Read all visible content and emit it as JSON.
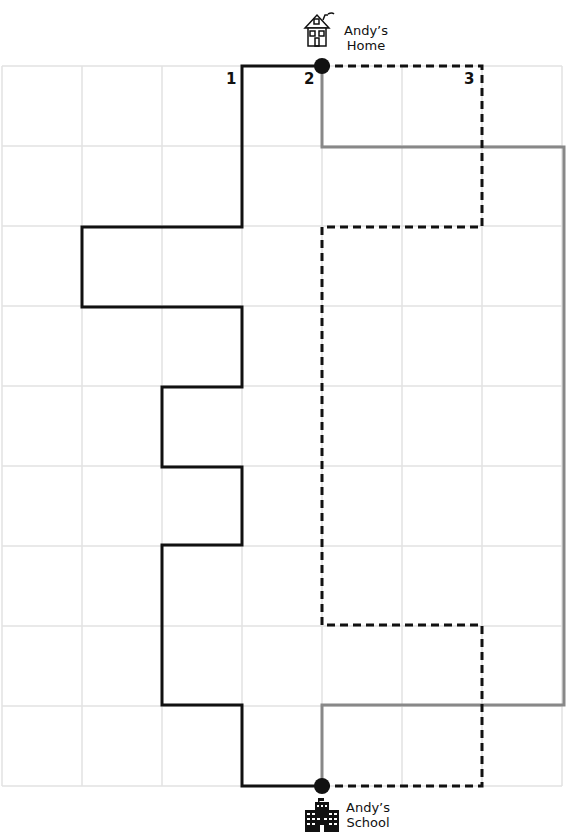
{
  "diagram": {
    "type": "grid-route-map",
    "grid": {
      "columns": 7,
      "rows": 9,
      "cell_size_px": 80,
      "origin": [
        2,
        66
      ],
      "line_color": "#e2e2e2"
    },
    "home": {
      "label_line1": "Andy’s",
      "label_line2": "Home",
      "point": [
        322,
        66
      ],
      "icon": "house-icon"
    },
    "school": {
      "label_line1": "Andy’s",
      "label_line2": "School",
      "point": [
        322,
        786
      ],
      "icon": "school-building-icon"
    },
    "routes": [
      {
        "id": "1",
        "label": "1",
        "style": "solid",
        "color": "#111111",
        "points": [
          [
            322,
            66
          ],
          [
            242,
            66
          ],
          [
            242,
            227
          ],
          [
            82,
            227
          ],
          [
            82,
            307
          ],
          [
            242,
            307
          ],
          [
            242,
            387
          ],
          [
            162,
            387
          ],
          [
            162,
            467
          ],
          [
            242,
            467
          ],
          [
            242,
            545
          ],
          [
            162,
            545
          ],
          [
            162,
            705
          ],
          [
            242,
            705
          ],
          [
            242,
            786
          ],
          [
            322,
            786
          ]
        ]
      },
      {
        "id": "2",
        "label": "2",
        "style": "solid",
        "color": "#888888",
        "points": [
          [
            322,
            66
          ],
          [
            322,
            147
          ],
          [
            564,
            147
          ],
          [
            564,
            705
          ],
          [
            322,
            705
          ],
          [
            322,
            786
          ]
        ]
      },
      {
        "id": "3",
        "label": "3",
        "style": "dashed",
        "color": "#111111",
        "points": [
          [
            322,
            66
          ],
          [
            482,
            66
          ],
          [
            482,
            227
          ],
          [
            322,
            227
          ],
          [
            322,
            625
          ],
          [
            482,
            625
          ],
          [
            482,
            786
          ],
          [
            322,
            786
          ]
        ]
      }
    ]
  }
}
